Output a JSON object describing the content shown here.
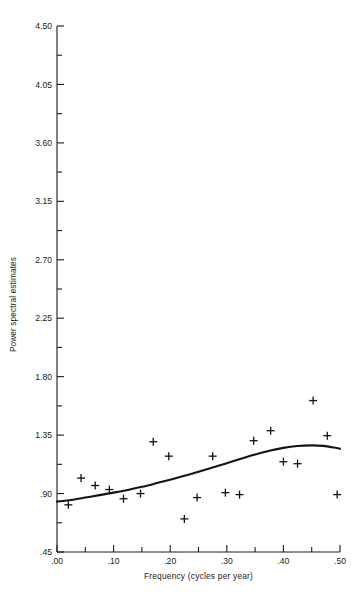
{
  "chart_data": {
    "type": "scatter",
    "title": "",
    "xlabel": "Frequency (cycles per year)",
    "ylabel": "Power spectral estimates",
    "xlim": [
      0.0,
      0.5
    ],
    "ylim": [
      0.45,
      4.5
    ],
    "grid": false,
    "legend": null,
    "xticks": [
      0.0,
      0.1,
      0.2,
      0.3,
      0.4,
      0.5
    ],
    "xtick_labels": [
      ".00",
      ".10",
      ".20",
      ".30",
      ".40",
      ".50"
    ],
    "xminor_ticks": [
      0.05,
      0.15,
      0.25,
      0.35,
      0.45
    ],
    "yticks": [
      0.45,
      0.9,
      1.35,
      1.8,
      2.25,
      2.7,
      3.15,
      3.6,
      4.05,
      4.5
    ],
    "ytick_labels": [
      ".45",
      ".90",
      "1.35",
      "1.80",
      "2.25",
      "2.70",
      "3.15",
      "3.60",
      "4.05",
      "4.50"
    ],
    "yminor_ticks": [
      0.675,
      1.125,
      1.575,
      2.025,
      2.475,
      2.925,
      3.375,
      3.825,
      4.275
    ],
    "marker": "plus",
    "series": [
      {
        "name": "Power spectral estimates",
        "type": "scatter",
        "points": [
          {
            "x": 0.02,
            "y": 0.813
          },
          {
            "x": 0.0425,
            "y": 1.019
          },
          {
            "x": 0.0675,
            "y": 0.962
          },
          {
            "x": 0.0925,
            "y": 0.931
          },
          {
            "x": 0.1175,
            "y": 0.86
          },
          {
            "x": 0.1475,
            "y": 0.9
          },
          {
            "x": 0.17,
            "y": 1.299
          },
          {
            "x": 0.1975,
            "y": 1.188
          },
          {
            "x": 0.225,
            "y": 0.705
          },
          {
            "x": 0.2475,
            "y": 0.869
          },
          {
            "x": 0.275,
            "y": 1.188
          },
          {
            "x": 0.2975,
            "y": 0.907
          },
          {
            "x": 0.3225,
            "y": 0.892
          },
          {
            "x": 0.3475,
            "y": 1.307
          },
          {
            "x": 0.3775,
            "y": 1.384
          },
          {
            "x": 0.4,
            "y": 1.145
          },
          {
            "x": 0.425,
            "y": 1.13
          },
          {
            "x": 0.4525,
            "y": 1.616
          },
          {
            "x": 0.4775,
            "y": 1.346
          },
          {
            "x": 0.495,
            "y": 0.892
          }
        ]
      },
      {
        "name": "Smoothed spectrum",
        "type": "line",
        "points": [
          {
            "x": 0.0,
            "y": 0.838
          },
          {
            "x": 0.025,
            "y": 0.851
          },
          {
            "x": 0.05,
            "y": 0.869
          },
          {
            "x": 0.075,
            "y": 0.888
          },
          {
            "x": 0.1,
            "y": 0.907
          },
          {
            "x": 0.125,
            "y": 0.928
          },
          {
            "x": 0.15,
            "y": 0.952
          },
          {
            "x": 0.175,
            "y": 0.979
          },
          {
            "x": 0.2,
            "y": 1.007
          },
          {
            "x": 0.225,
            "y": 1.037
          },
          {
            "x": 0.25,
            "y": 1.068
          },
          {
            "x": 0.275,
            "y": 1.1
          },
          {
            "x": 0.3,
            "y": 1.134
          },
          {
            "x": 0.325,
            "y": 1.168
          },
          {
            "x": 0.35,
            "y": 1.2
          },
          {
            "x": 0.375,
            "y": 1.229
          },
          {
            "x": 0.4,
            "y": 1.252
          },
          {
            "x": 0.425,
            "y": 1.266
          },
          {
            "x": 0.45,
            "y": 1.271
          },
          {
            "x": 0.47,
            "y": 1.267
          },
          {
            "x": 0.49,
            "y": 1.254
          },
          {
            "x": 0.5,
            "y": 1.245
          }
        ]
      }
    ]
  }
}
